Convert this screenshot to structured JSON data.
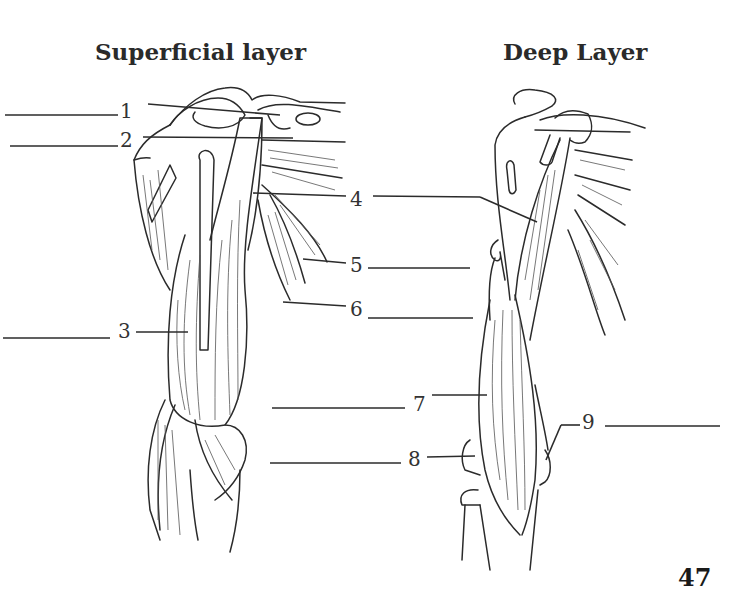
{
  "titles": {
    "superficial": "Superficial layer",
    "deep": "Deep Layer"
  },
  "labels": [
    {
      "number": "1",
      "answer": ""
    },
    {
      "number": "2",
      "answer": ""
    },
    {
      "number": "3",
      "answer": ""
    },
    {
      "number": "4",
      "answer": ""
    },
    {
      "number": "5",
      "answer": ""
    },
    {
      "number": "6",
      "answer": ""
    },
    {
      "number": "7",
      "answer": ""
    },
    {
      "number": "8",
      "answer": ""
    },
    {
      "number": "9",
      "answer": ""
    }
  ],
  "page_number": "47"
}
